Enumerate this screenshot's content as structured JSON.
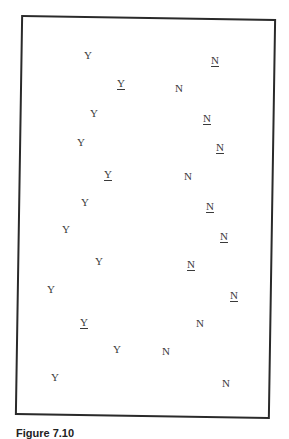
{
  "figure": {
    "caption_visible_fragment": "Figure 7.10"
  },
  "legend": {
    "symbols": {
      "Y": "Y",
      "N": "N"
    },
    "underline_meaning": "underlined variant"
  },
  "items": [
    {
      "label": "Y",
      "underlined": false,
      "x": 88,
      "y": 55
    },
    {
      "label": "Y",
      "underlined": true,
      "x": 121,
      "y": 83
    },
    {
      "label": "Y",
      "underlined": false,
      "x": 94,
      "y": 113
    },
    {
      "label": "Y",
      "underlined": false,
      "x": 81,
      "y": 142
    },
    {
      "label": "Y",
      "underlined": true,
      "x": 108,
      "y": 174
    },
    {
      "label": "Y",
      "underlined": false,
      "x": 85,
      "y": 202
    },
    {
      "label": "Y",
      "underlined": false,
      "x": 66,
      "y": 229
    },
    {
      "label": "Y",
      "underlined": false,
      "x": 99,
      "y": 261
    },
    {
      "label": "Y",
      "underlined": false,
      "x": 51,
      "y": 289
    },
    {
      "label": "Y",
      "underlined": true,
      "x": 84,
      "y": 322
    },
    {
      "label": "Y",
      "underlined": false,
      "x": 117,
      "y": 349
    },
    {
      "label": "Y",
      "underlined": false,
      "x": 55,
      "y": 377
    },
    {
      "label": "N",
      "underlined": true,
      "x": 215,
      "y": 60
    },
    {
      "label": "N",
      "underlined": false,
      "x": 179,
      "y": 88
    },
    {
      "label": "N",
      "underlined": true,
      "x": 207,
      "y": 118
    },
    {
      "label": "N",
      "underlined": true,
      "x": 220,
      "y": 147
    },
    {
      "label": "N",
      "underlined": false,
      "x": 188,
      "y": 176
    },
    {
      "label": "N",
      "underlined": true,
      "x": 210,
      "y": 206
    },
    {
      "label": "N",
      "underlined": true,
      "x": 224,
      "y": 236
    },
    {
      "label": "N",
      "underlined": true,
      "x": 191,
      "y": 264
    },
    {
      "label": "N",
      "underlined": true,
      "x": 234,
      "y": 295
    },
    {
      "label": "N",
      "underlined": false,
      "x": 200,
      "y": 323
    },
    {
      "label": "N",
      "underlined": false,
      "x": 166,
      "y": 351
    },
    {
      "label": "N",
      "underlined": false,
      "x": 226,
      "y": 383
    }
  ],
  "colors": {
    "frame": "#2a2a2a",
    "text": "#3a3a3a",
    "background": "#ffffff"
  }
}
